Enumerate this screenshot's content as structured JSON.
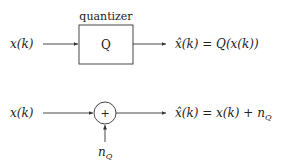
{
  "diagram": {
    "top": {
      "block_caption": "quantizer",
      "block_symbol": "Q",
      "input_label": "x(k)",
      "output_label": "x̂(k) = Q(x(k))"
    },
    "bottom": {
      "input_label": "x(k)",
      "sum_symbol": "+",
      "noise_label_base": "n",
      "noise_label_sub": "Q",
      "output_label_main": "x̂(k) = x(k) + n",
      "output_label_sub": "Q"
    },
    "colors": {
      "stroke": "#333333",
      "text": "#222222"
    }
  }
}
